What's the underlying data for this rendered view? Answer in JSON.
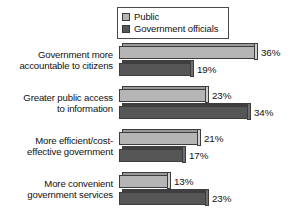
{
  "chart_data": {
    "type": "bar",
    "orientation": "horizontal",
    "title": "",
    "subtitle": "",
    "xlabel": "",
    "ylabel": "",
    "grid": false,
    "legend_position": "top-right",
    "value_suffix": "%",
    "xlim": [
      0,
      36
    ],
    "categories": [
      "Government more accountable to citizens",
      "Greater public access to information",
      "More efficient/cost-effective government",
      "More convenient government services"
    ],
    "category_lines": [
      [
        "Government more",
        "accountable to citizens"
      ],
      [
        "Greater public access",
        "to information"
      ],
      [
        "More efficient/cost-",
        "effective government"
      ],
      [
        "More convenient",
        "government services"
      ]
    ],
    "series": [
      {
        "name": "Public",
        "color": "#b5b5b5",
        "values": [
          36,
          23,
          21,
          13
        ],
        "labels": [
          "36%",
          "23%",
          "21%",
          "13%"
        ]
      },
      {
        "name": "Government officials",
        "color": "#565656",
        "values": [
          19,
          34,
          17,
          23
        ],
        "labels": [
          "19%",
          "34%",
          "17%",
          "23%"
        ]
      }
    ]
  },
  "legend": {
    "items": [
      {
        "label": "Public",
        "swatch": "sw-public"
      },
      {
        "label": "Government officials",
        "swatch": "sw-official"
      }
    ]
  }
}
